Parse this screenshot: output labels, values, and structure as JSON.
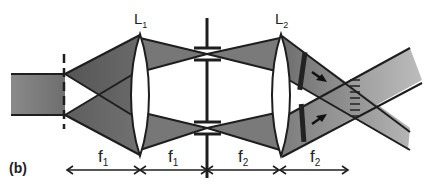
{
  "figure": {
    "panel_label": "(b)",
    "lenses": [
      {
        "name": "L",
        "sub": "1"
      },
      {
        "name": "L",
        "sub": "2"
      }
    ],
    "distances": [
      {
        "name": "f",
        "sub": "1"
      },
      {
        "name": "f",
        "sub": "1"
      },
      {
        "name": "f",
        "sub": "2"
      },
      {
        "name": "f",
        "sub": "2"
      }
    ],
    "colors": {
      "line": "#1e1e1e",
      "beam_dark": "#5a5a5a",
      "beam_mid": "#7a7a7a",
      "beam_light": "#a8a8a8",
      "lens_fill": "#ffffff"
    }
  }
}
